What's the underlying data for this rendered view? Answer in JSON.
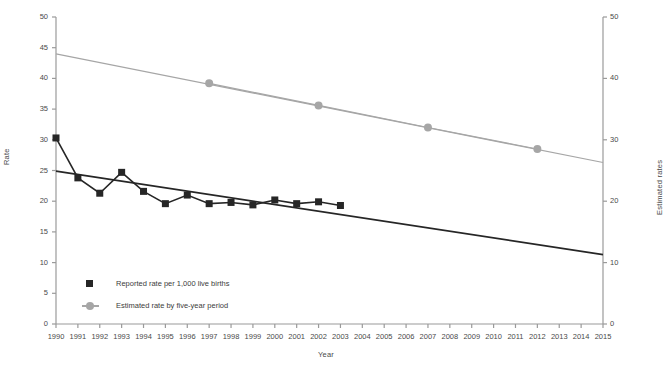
{
  "chart_data": {
    "type": "line",
    "title": "",
    "xlabel": "Year",
    "ylabel": "Rate",
    "y2label": "Estimated rates",
    "xlim": [
      1990,
      2015
    ],
    "ylim": [
      0,
      50
    ],
    "y2lim": [
      0,
      50
    ],
    "grid": false,
    "legend_position": "lower-left",
    "xticks": [
      "1990",
      "1991",
      "1992",
      "1993",
      "1994",
      "1995",
      "1996",
      "1997",
      "1998",
      "1999",
      "2000",
      "2001",
      "2002",
      "2003",
      "2004",
      "2005",
      "2006",
      "2007",
      "2008",
      "2009",
      "2010",
      "2011",
      "2012",
      "2013",
      "2014",
      "2015"
    ],
    "yticks": [
      "0",
      "5",
      "10",
      "15",
      "20",
      "25",
      "30",
      "35",
      "40",
      "45",
      "50"
    ],
    "y2ticks": [
      "0",
      "10",
      "20",
      "30",
      "40",
      "50"
    ],
    "series": [
      {
        "name": "Reported rate per 1,000 live births",
        "marker": "square",
        "color": "#262626",
        "axis": "left",
        "x": [
          1990,
          1991,
          1992,
          1993,
          1994,
          1995,
          1996,
          1997,
          1998,
          1999,
          2000,
          2001,
          2002,
          2003
        ],
        "values": [
          30.3,
          23.8,
          21.3,
          24.7,
          21.6,
          19.6,
          21.0,
          19.6,
          19.8,
          19.4,
          20.2,
          19.6,
          19.9,
          19.3
        ]
      },
      {
        "name": "Estimated rate by five-year period",
        "marker": "circle",
        "color": "#a6a6a6",
        "axis": "right",
        "x": [
          1997,
          2002,
          2007,
          2012
        ],
        "values": [
          39.2,
          35.6,
          32.0,
          28.5
        ]
      }
    ],
    "trend_lines": [
      {
        "name": "reported-trend",
        "color": "#262626",
        "x": [
          1990,
          2015
        ],
        "values": [
          24.9,
          11.3
        ]
      },
      {
        "name": "estimated-trend",
        "color": "#a6a6a6",
        "x": [
          1990,
          2015
        ],
        "values": [
          44.0,
          26.3
        ]
      }
    ],
    "legend": [
      {
        "label": "Reported rate per 1,000 live births",
        "marker": "square",
        "color": "#262626"
      },
      {
        "label": "Estimated rate by five-year period",
        "marker": "circle-line",
        "color": "#a6a6a6"
      }
    ]
  }
}
